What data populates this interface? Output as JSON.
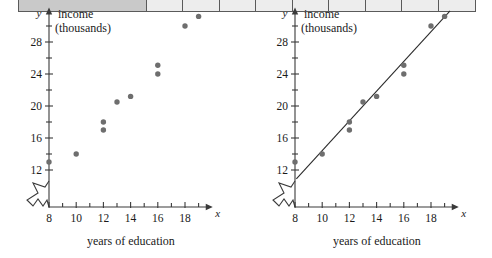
{
  "top_strip": {
    "name": "cut-off-table-row",
    "cells": [
      "",
      "",
      "",
      "",
      "",
      "",
      "",
      "",
      "",
      ""
    ]
  },
  "chart_data": [
    {
      "id": "left",
      "type": "scatter",
      "title": "",
      "xlabel": "years of education",
      "ylabel": "income",
      "ylabel_unit": "(thousands)",
      "x_axis_symbol": "x",
      "y_axis_symbol": "y",
      "xlim": [
        8,
        19.6
      ],
      "ylim": [
        10.6,
        31.8
      ],
      "xticks": [
        8,
        10,
        12,
        14,
        16,
        18
      ],
      "xticklabels": [
        "8",
        "10",
        "12",
        "14",
        "16",
        "18"
      ],
      "xminorticks": [
        9,
        11,
        13,
        15,
        17,
        19
      ],
      "yticks": [
        12,
        16,
        20,
        24,
        28
      ],
      "yticklabels": [
        "12",
        "16",
        "20",
        "24",
        "28"
      ],
      "yminorticks": [
        14,
        18,
        22,
        26,
        30
      ],
      "axis_break": true,
      "grid": false,
      "legend": "none",
      "point_color": "#6e6e6e",
      "has_trendline": false,
      "points": [
        {
          "x": 8,
          "y": 13.0
        },
        {
          "x": 10,
          "y": 14.0
        },
        {
          "x": 12,
          "y": 17.0
        },
        {
          "x": 12,
          "y": 18.0
        },
        {
          "x": 13,
          "y": 20.5
        },
        {
          "x": 14,
          "y": 21.2
        },
        {
          "x": 16,
          "y": 24.0
        },
        {
          "x": 16,
          "y": 25.1
        },
        {
          "x": 18,
          "y": 30.0
        },
        {
          "x": 19,
          "y": 31.2
        }
      ]
    },
    {
      "id": "right",
      "type": "scatter",
      "title": "",
      "xlabel": "years of education",
      "ylabel": "income",
      "ylabel_unit": "(thousands)",
      "x_axis_symbol": "x",
      "y_axis_symbol": "y",
      "xlim": [
        8,
        19.6
      ],
      "ylim": [
        10.6,
        31.8
      ],
      "xticks": [
        8,
        10,
        12,
        14,
        16,
        18
      ],
      "xticklabels": [
        "8",
        "10",
        "12",
        "14",
        "16",
        "18"
      ],
      "xminorticks": [
        9,
        11,
        13,
        15,
        17,
        19
      ],
      "yticks": [
        12,
        16,
        20,
        24,
        28
      ],
      "yticklabels": [
        "12",
        "16",
        "20",
        "24",
        "28"
      ],
      "yminorticks": [
        14,
        18,
        22,
        26,
        30
      ],
      "axis_break": true,
      "grid": false,
      "legend": "none",
      "point_color": "#6e6e6e",
      "has_trendline": true,
      "trendline_color": "#2b2b2b",
      "trendline": {
        "x0": 8.1,
        "y0": 10.9,
        "x1": 19.4,
        "y1": 31.9
      },
      "points": [
        {
          "x": 8,
          "y": 13.0
        },
        {
          "x": 10,
          "y": 14.0
        },
        {
          "x": 12,
          "y": 17.0
        },
        {
          "x": 12,
          "y": 18.0
        },
        {
          "x": 13,
          "y": 20.5
        },
        {
          "x": 14,
          "y": 21.2
        },
        {
          "x": 16,
          "y": 24.0
        },
        {
          "x": 16,
          "y": 25.1
        },
        {
          "x": 18,
          "y": 30.0
        },
        {
          "x": 19,
          "y": 31.2
        }
      ]
    }
  ]
}
